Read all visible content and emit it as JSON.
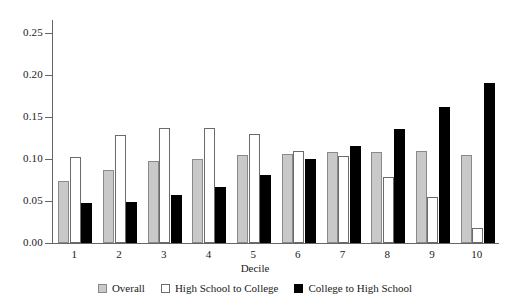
{
  "chart_data": {
    "type": "bar",
    "title": "",
    "subtitle": "",
    "xlabel": "Decile",
    "ylabel": "",
    "categories": [
      "1",
      "2",
      "3",
      "4",
      "5",
      "6",
      "7",
      "8",
      "9",
      "10"
    ],
    "series": [
      {
        "name": "Overall",
        "color": "#c9c9c9",
        "values": [
          0.074,
          0.087,
          0.097,
          0.1,
          0.104,
          0.106,
          0.108,
          0.108,
          0.109,
          0.104
        ]
      },
      {
        "name": "High School to College",
        "color": "#ffffff",
        "values": [
          0.102,
          0.128,
          0.137,
          0.137,
          0.129,
          0.109,
          0.103,
          0.079,
          0.055,
          0.018
        ]
      },
      {
        "name": "College to High School",
        "color": "#000000",
        "values": [
          0.047,
          0.049,
          0.057,
          0.066,
          0.081,
          0.1,
          0.115,
          0.136,
          0.162,
          0.19
        ]
      }
    ],
    "ylim": [
      0.0,
      0.265
    ],
    "yticks": [
      0.0,
      0.05,
      0.1,
      0.15,
      0.2,
      0.25
    ],
    "ytick_labels": [
      "0.00",
      "0.05",
      "0.10",
      "0.15",
      "0.20",
      "0.25"
    ],
    "grid": false,
    "legend_position": "bottom"
  },
  "legend": {
    "items": [
      {
        "label": "Overall",
        "swatch": "overall"
      },
      {
        "label": "High School to College",
        "swatch": "hs2c"
      },
      {
        "label": "College to High School",
        "swatch": "c2hs"
      }
    ]
  }
}
